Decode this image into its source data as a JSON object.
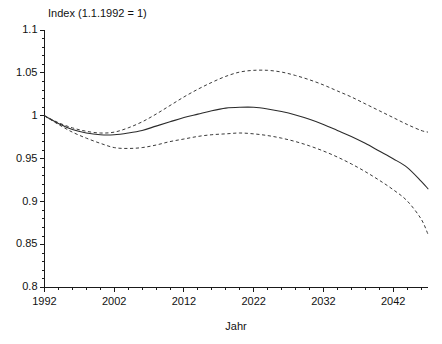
{
  "chart_data": {
    "type": "line",
    "title": "Index (1.1.1992 = 1)",
    "xlabel": "Jahr",
    "ylabel": "",
    "xlim": [
      1992,
      2047
    ],
    "ylim": [
      0.8,
      1.1
    ],
    "grid": false,
    "legend": "none",
    "xticks": [
      1992,
      2002,
      2012,
      2022,
      2032,
      2042
    ],
    "xtick_labels": [
      "1992",
      "2002",
      "2012",
      "2022",
      "2032",
      "2042"
    ],
    "yticks": [
      0.8,
      0.85,
      0.9,
      0.95,
      1,
      1.05,
      1.1
    ],
    "ytick_labels": [
      "0.8",
      "0.85",
      "0.9",
      "0.95",
      "1",
      "1.05",
      "1.1"
    ],
    "x_minor_tick_interval": 2,
    "y_minor_tick_interval": 0.01,
    "x": [
      1992,
      1994,
      1996,
      1998,
      2000,
      2002,
      2004,
      2006,
      2008,
      2010,
      2012,
      2014,
      2016,
      2018,
      2020,
      2022,
      2024,
      2026,
      2028,
      2030,
      2032,
      2034,
      2036,
      2038,
      2040,
      2042,
      2044,
      2046,
      2047
    ],
    "series": [
      {
        "name": "upper-bound",
        "style": "dashed",
        "color": "#3a3a3a",
        "values": [
          1.0,
          0.992,
          0.986,
          0.982,
          0.98,
          0.981,
          0.986,
          0.993,
          1.002,
          1.012,
          1.022,
          1.031,
          1.039,
          1.046,
          1.051,
          1.053,
          1.053,
          1.051,
          1.047,
          1.042,
          1.036,
          1.029,
          1.022,
          1.014,
          1.006,
          0.998,
          0.99,
          0.983,
          0.981
        ]
      },
      {
        "name": "central-projection",
        "style": "solid",
        "color": "#2b2b2b",
        "values": [
          1.0,
          0.991,
          0.984,
          0.98,
          0.978,
          0.978,
          0.98,
          0.983,
          0.988,
          0.993,
          0.998,
          1.002,
          1.006,
          1.009,
          1.01,
          1.01,
          1.008,
          1.005,
          1.001,
          0.996,
          0.99,
          0.983,
          0.976,
          0.968,
          0.959,
          0.95,
          0.94,
          0.924,
          0.915
        ]
      },
      {
        "name": "lower-bound",
        "style": "dashed",
        "color": "#3a3a3a",
        "values": [
          1.0,
          0.99,
          0.981,
          0.974,
          0.968,
          0.963,
          0.962,
          0.963,
          0.966,
          0.97,
          0.973,
          0.976,
          0.978,
          0.979,
          0.98,
          0.979,
          0.977,
          0.974,
          0.97,
          0.965,
          0.959,
          0.952,
          0.944,
          0.935,
          0.925,
          0.914,
          0.901,
          0.88,
          0.862
        ]
      }
    ]
  },
  "figure": {
    "background_color": "#ffffff",
    "axis_color": "#1a1a1a"
  }
}
